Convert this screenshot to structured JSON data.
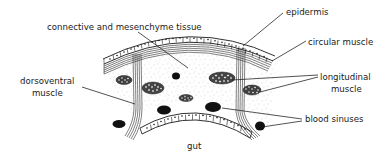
{
  "diagram": {
    "labels": {
      "connective": "connective and mesenchyme tissue",
      "epidermis": "epidermis",
      "circular_muscle": "circular muscle",
      "longitudinal_line1": "longitudinal",
      "longitudinal_line2": "muscle",
      "dorsoventral_line1": "dorsoventral",
      "dorsoventral_line2": "muscle",
      "blood_sinuses": "blood sinuses",
      "gut": "gut"
    },
    "colors": {
      "ink": "#1a1a1a",
      "fill": "#ffffff",
      "stipple": "#9a9a9a"
    }
  }
}
